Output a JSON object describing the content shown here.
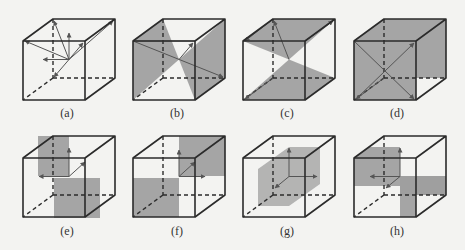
{
  "figure": {
    "colors": {
      "background": "#f3f3f1",
      "edge": "#2b2b2b",
      "plane_fill": "#9e9e9e",
      "arrow": "#555555"
    },
    "panels": [
      {
        "id": "a",
        "label": "(a)",
        "content": "symmetry axes (arrows) from cube center to corners, edges and faces"
      },
      {
        "id": "b",
        "label": "(b)",
        "content": "diagonal mirror plane with axis arrows"
      },
      {
        "id": "c",
        "label": "(c)",
        "content": "two triangular shaded regions (top face and bottom) with diagonal arrows"
      },
      {
        "id": "d",
        "label": "(d)",
        "content": "diagonal plane through opposite edges with body diagonal arrows"
      },
      {
        "id": "e",
        "label": "(e)",
        "content": "two shaded octant blocks (upper-left-back and lower-right-front) with axis arrows"
      },
      {
        "id": "f",
        "label": "(f)",
        "content": "two shaded octant blocks (upper-right and lower-left) with axis arrows"
      },
      {
        "id": "g",
        "label": "(g)",
        "content": "central shaded vertical plane with axis arrows"
      },
      {
        "id": "h",
        "label": "(h)",
        "content": "two shaded blocks (upper-left and lower-right) with axis arrows"
      }
    ]
  }
}
